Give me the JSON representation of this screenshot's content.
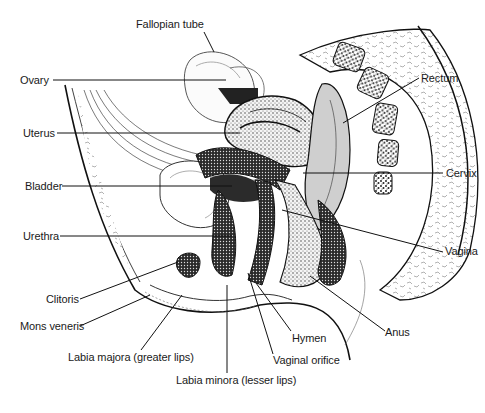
{
  "figure": {
    "labels": [
      {
        "id": "fallopian-tube",
        "text": "Fallopian tube",
        "x": 176,
        "y": 18
      },
      {
        "id": "ovary",
        "text": "Ovary",
        "x": 20,
        "y": 74
      },
      {
        "id": "uterus",
        "text": "Uterus",
        "x": 23,
        "y": 127
      },
      {
        "id": "bladder",
        "text": "Bladder",
        "x": 25,
        "y": 180
      },
      {
        "id": "urethra",
        "text": "Urethra",
        "x": 23,
        "y": 230
      },
      {
        "id": "clitoris",
        "text": "Clitoris",
        "x": 46,
        "y": 293
      },
      {
        "id": "mons-veneris",
        "text": "Mons veneris",
        "x": 20,
        "y": 320
      },
      {
        "id": "labia-majora",
        "text": "Labia majora (greater lips)",
        "x": 68,
        "y": 351
      },
      {
        "id": "labia-minora",
        "text": "Labia minora (lesser lips)",
        "x": 176,
        "y": 373
      },
      {
        "id": "rectum",
        "text": "Rectum",
        "x": 422,
        "y": 72
      },
      {
        "id": "cervix",
        "text": "Cervix",
        "x": 446,
        "y": 168
      },
      {
        "id": "vagina",
        "text": "Vagina",
        "x": 446,
        "y": 246
      },
      {
        "id": "anus",
        "text": "Anus",
        "x": 384,
        "y": 326
      },
      {
        "id": "hymen",
        "text": "Hymen",
        "x": 292,
        "y": 332
      },
      {
        "id": "vaginal-orifice",
        "text": "Vaginal orifice",
        "x": 273,
        "y": 354
      }
    ]
  }
}
